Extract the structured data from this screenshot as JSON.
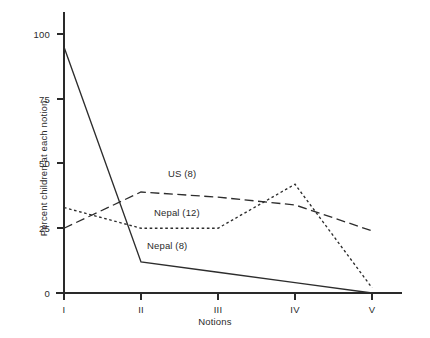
{
  "chart_data": {
    "type": "line",
    "title": "",
    "xlabel": "Notions",
    "ylabel": "Percent children at each notion",
    "categories": [
      "I",
      "II",
      "III",
      "IV",
      "V"
    ],
    "ylim": [
      0,
      100
    ],
    "yticks": [
      0,
      25,
      50,
      75,
      100
    ],
    "ytick_labels": [
      "0",
      "25",
      "50",
      "75",
      "100"
    ],
    "grid": false,
    "legend_position": "inline-annotations",
    "series": [
      {
        "name": "Nepal (8)",
        "style": "solid",
        "values": [
          95,
          12,
          8,
          4,
          0
        ]
      },
      {
        "name": "US (8)",
        "style": "dashed",
        "values": [
          25,
          39,
          37,
          34,
          24
        ]
      },
      {
        "name": "Nepal (12)",
        "style": "dotted",
        "values": [
          33,
          25,
          25,
          42,
          2
        ]
      }
    ],
    "annotations": [
      {
        "text": "US (8)",
        "x_px": 168,
        "y_px": 168
      },
      {
        "text": "Nepal (12)",
        "x_px": 154,
        "y_px": 207
      },
      {
        "text": "Nepal (8)",
        "x_px": 147,
        "y_px": 240
      }
    ]
  },
  "axes": {
    "y_title": "Percent children at each notion",
    "x_title": "Notions",
    "y_labels": [
      "100",
      "75",
      "50",
      "25",
      "0"
    ],
    "x_labels": [
      "I",
      "II",
      "III",
      "IV",
      "V"
    ]
  }
}
